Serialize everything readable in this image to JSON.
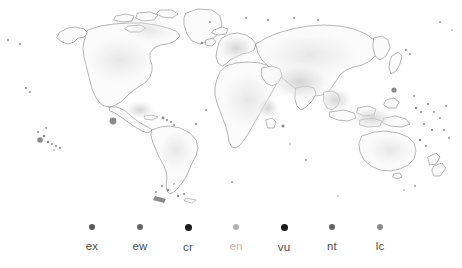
{
  "figure": {
    "name": "iucn-red-list-category-world-map",
    "background_color": "#ffffff"
  },
  "map": {
    "name": "world-map",
    "projection": "equirectangular",
    "land_fill_color": "#fbfbfb",
    "land_outline_color": "#6f6f6f",
    "shading_color": "#d9d9d9"
  },
  "legend": {
    "name": "iucn-category-legend",
    "orientation": "horizontal",
    "items": [
      {
        "label": "ex",
        "color": "#595959",
        "dot_size": 6,
        "x": 92
      },
      {
        "label": "ew",
        "color": "#666666",
        "dot_size": 6,
        "x": 140
      },
      {
        "label": "cr",
        "color": "#1a1a1a",
        "dot_size": 7,
        "x": 188
      },
      {
        "label": "en",
        "color": "#b3b3b3",
        "dot_size": 6,
        "x": 236
      },
      {
        "label": "vu",
        "color": "#1a1a1a",
        "dot_size": 7,
        "x": 284
      },
      {
        "label": "nt",
        "color": "#636363",
        "dot_size": 6,
        "x": 332
      },
      {
        "label": "lc",
        "color": "#8c8c8c",
        "dot_size": 6,
        "x": 380
      }
    ],
    "label_colors": {
      "ex": "#4d4d4d",
      "ew": "#4d4d4d",
      "cr": "#4d4d4d",
      "en": "#b8b8b8",
      "vu": "#4d4d4d",
      "nt": "#4d4d4d",
      "lc": "#4d4d4d"
    }
  }
}
